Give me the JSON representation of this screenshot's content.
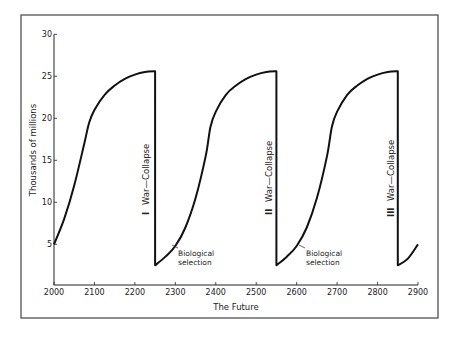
{
  "chart_data": {
    "type": "line",
    "title": "",
    "xlabel": "The Future",
    "ylabel": "Thousands of millions",
    "xlim": [
      2000,
      2900
    ],
    "ylim": [
      0,
      30
    ],
    "x_ticks": [
      2000,
      2100,
      2200,
      2300,
      2400,
      2500,
      2600,
      2700,
      2800,
      2900
    ],
    "y_ticks": [
      5,
      10,
      15,
      20,
      25,
      30
    ],
    "grid": false,
    "legend": null,
    "series": [
      {
        "name": "World population",
        "x": [
          2000,
          2025,
          2050,
          2075,
          2087,
          2100,
          2125,
          2150,
          2175,
          2200,
          2225,
          2250,
          2250,
          2275,
          2300,
          2325,
          2350,
          2375,
          2387,
          2400,
          2425,
          2450,
          2475,
          2500,
          2525,
          2550,
          2550,
          2575,
          2600,
          2625,
          2650,
          2675,
          2687,
          2700,
          2725,
          2750,
          2775,
          2800,
          2825,
          2850,
          2850,
          2875,
          2900
        ],
        "y": [
          5.0,
          8.0,
          12.0,
          17.0,
          19.5,
          21.0,
          22.8,
          23.9,
          24.7,
          25.2,
          25.5,
          25.6,
          2.5,
          3.5,
          4.8,
          7.0,
          10.5,
          15.5,
          19.0,
          20.8,
          22.8,
          23.9,
          24.7,
          25.2,
          25.5,
          25.6,
          2.5,
          3.5,
          4.8,
          7.0,
          10.5,
          15.5,
          19.0,
          20.8,
          22.8,
          23.9,
          24.7,
          25.2,
          25.5,
          25.6,
          2.5,
          3.3,
          5.0
        ]
      }
    ],
    "annotations": [
      {
        "text": "I  War—Collapse",
        "x": 2250,
        "orientation": "vertical"
      },
      {
        "text": "II  War—Collapse",
        "x": 2550,
        "orientation": "vertical"
      },
      {
        "text": "III  War—Collapse",
        "x": 2850,
        "orientation": "vertical"
      },
      {
        "text": "Biological selection",
        "x": 2305,
        "y": 5.0,
        "arrow": true
      },
      {
        "text": "Biological selection",
        "x": 2605,
        "y": 5.0,
        "arrow": true
      }
    ]
  },
  "labels": {
    "xlabel": "The Future",
    "ylabel": "Thousands of millions",
    "collapse1_num": "I",
    "collapse2_num": "II",
    "collapse3_num": "III",
    "collapse_text": "War—Collapse",
    "bio1_line1": "Biological",
    "bio1_line2": "selection",
    "bio2_line1": "Biological",
    "bio2_line2": "selection"
  }
}
